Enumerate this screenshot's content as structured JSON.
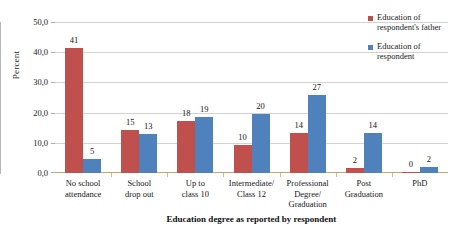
{
  "chart_data": {
    "type": "bar",
    "title": "",
    "xlabel": "Education degree as reported by respondent",
    "ylabel": "Percent",
    "ylim": [
      0,
      50
    ],
    "ytick_labels": [
      "50,0",
      "40,0",
      "30,0",
      "20,0",
      "10,0",
      "0,0"
    ],
    "ytick_values": [
      50,
      40,
      30,
      20,
      10,
      0
    ],
    "grid": true,
    "legend_position": "right",
    "categories": [
      "No school attendance",
      "School drop out",
      "Up to class 10",
      "Intermediate/ Class 12",
      "Professional Degree/ Graduation",
      "Post Graduation",
      "PhD"
    ],
    "category_lines": [
      [
        "No school",
        "attendance"
      ],
      [
        "School",
        "drop out"
      ],
      [
        "Up to",
        "class 10"
      ],
      [
        "Intermediate/",
        "Class 12"
      ],
      [
        "Professional",
        "Degree/",
        "Graduation"
      ],
      [
        "Post",
        "Graduation"
      ],
      [
        "PhD"
      ]
    ],
    "series": [
      {
        "name": "Education of respondent's father",
        "color": "#c0504d",
        "values": [
          41,
          15,
          18,
          10,
          14,
          2,
          0
        ],
        "bar_values_plotted": [
          41.3,
          14.2,
          17.1,
          9.3,
          13.3,
          1.5,
          0.2
        ]
      },
      {
        "name": "Education of respondent",
        "color": "#4f81bd",
        "values": [
          5,
          13,
          19,
          20,
          27,
          14,
          2
        ],
        "bar_values_plotted": [
          4.5,
          12.9,
          18.4,
          19.4,
          25.8,
          13.3,
          2.0
        ]
      }
    ]
  },
  "legend": {
    "items": [
      {
        "label_line1": "Education of",
        "label_line2": "respondent's father",
        "color": "#c0504d"
      },
      {
        "label_line1": "Education of",
        "label_line2": "respondent",
        "color": "#4f81bd"
      }
    ]
  }
}
